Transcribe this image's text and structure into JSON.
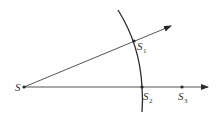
{
  "diagram": {
    "colors": {
      "line": "#2a2a2a",
      "text": "#333333",
      "background": "#ffffff"
    },
    "points": {
      "S": {
        "label": "S",
        "sub": ""
      },
      "S1": {
        "label": "S",
        "sub": "1"
      },
      "S2": {
        "label": "S",
        "sub": "2"
      },
      "S3": {
        "label": "S",
        "sub": "3"
      }
    },
    "rays": [
      "S → through S1 (inclined)",
      "S → through S2, S3 (horizontal)"
    ],
    "arc": "circular arc crossing both rays at S1 and S2"
  }
}
